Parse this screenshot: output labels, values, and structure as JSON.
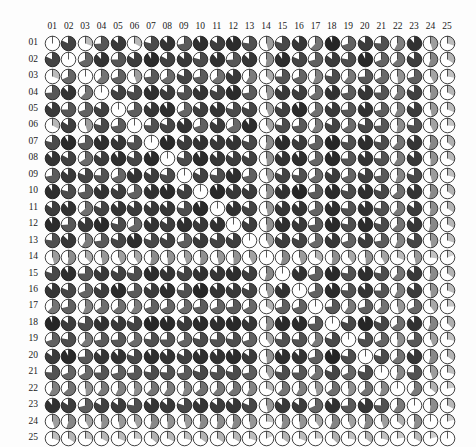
{
  "figure": {
    "type": "pie-glyph-matrix",
    "background_color": "#fdfdfd",
    "grid_left": 44,
    "grid_top": 35,
    "cell_pitch": 16.45,
    "glyph_radius": 7.3,
    "outline_color": "#111111",
    "empty_color": "#ffffff"
  },
  "chart_data": {
    "type": "heatmap",
    "title": "",
    "subtitle": "",
    "xlabel": "",
    "ylabel": "",
    "legend": [],
    "grid": false,
    "encoding": {
      "glyph": "pie",
      "start_angle_deg": 0,
      "direction": "clockwise",
      "value_to_sweep": "fraction of 360 degrees",
      "value_to_shade": "darker grey for larger magnitude",
      "diagonal": "empty white circle (self-reference)",
      "symmetric": true
    },
    "shade_scale": {
      "stops": [
        {
          "value": 0.0,
          "color": "#ffffff"
        },
        {
          "value": 0.15,
          "color": "#d8d8d8"
        },
        {
          "value": 0.3,
          "color": "#bdbdbd"
        },
        {
          "value": 0.45,
          "color": "#9e9e9e"
        },
        {
          "value": 0.6,
          "color": "#7a7a7a"
        },
        {
          "value": 0.75,
          "color": "#555555"
        },
        {
          "value": 0.88,
          "color": "#333333"
        },
        {
          "value": 1.0,
          "color": "#151515"
        }
      ]
    },
    "xlim": [
      0,
      25
    ],
    "ylim": [
      0,
      25
    ],
    "categories": [
      "01",
      "02",
      "03",
      "04",
      "05",
      "06",
      "07",
      "08",
      "09",
      "10",
      "11",
      "12",
      "13",
      "14",
      "15",
      "16",
      "17",
      "18",
      "19",
      "20",
      "21",
      "22",
      "23",
      "24",
      "25"
    ],
    "column_labels": [
      "01",
      "02",
      "03",
      "04",
      "05",
      "06",
      "07",
      "08",
      "09",
      "10",
      "11",
      "12",
      "13",
      "14",
      "15",
      "16",
      "17",
      "18",
      "19",
      "20",
      "21",
      "22",
      "23",
      "24",
      "25"
    ],
    "row_labels": [
      "01",
      "02",
      "03",
      "04",
      "05",
      "06",
      "07",
      "08",
      "09",
      "10",
      "11",
      "12",
      "13",
      "14",
      "15",
      "16",
      "17",
      "18",
      "19",
      "20",
      "21",
      "22",
      "23",
      "24",
      "25"
    ],
    "values": [
      [
        0.0,
        0.82,
        0.31,
        0.74,
        0.86,
        0.33,
        0.79,
        0.88,
        0.72,
        0.9,
        0.84,
        0.91,
        0.77,
        0.46,
        0.8,
        0.87,
        0.62,
        0.93,
        0.7,
        0.85,
        0.76,
        0.58,
        0.89,
        0.45,
        0.3
      ],
      [
        0.82,
        0.0,
        0.68,
        0.88,
        0.75,
        0.84,
        0.91,
        0.83,
        0.86,
        0.79,
        0.89,
        0.74,
        0.87,
        0.52,
        0.9,
        0.81,
        0.71,
        0.85,
        0.78,
        0.92,
        0.69,
        0.63,
        0.84,
        0.55,
        0.34
      ],
      [
        0.31,
        0.68,
        0.0,
        0.62,
        0.7,
        0.45,
        0.73,
        0.66,
        0.81,
        0.72,
        0.64,
        0.86,
        0.59,
        0.38,
        0.75,
        0.69,
        0.56,
        0.78,
        0.61,
        0.74,
        0.67,
        0.49,
        0.71,
        0.42,
        0.28
      ],
      [
        0.74,
        0.88,
        0.62,
        0.0,
        0.83,
        0.79,
        0.9,
        0.85,
        0.76,
        0.88,
        0.82,
        0.91,
        0.73,
        0.48,
        0.86,
        0.84,
        0.65,
        0.89,
        0.72,
        0.87,
        0.75,
        0.6,
        0.83,
        0.51,
        0.33
      ],
      [
        0.86,
        0.75,
        0.7,
        0.83,
        0.0,
        0.72,
        0.87,
        0.9,
        0.68,
        0.84,
        0.88,
        0.79,
        0.81,
        0.44,
        0.83,
        0.91,
        0.64,
        0.86,
        0.74,
        0.89,
        0.71,
        0.57,
        0.85,
        0.47,
        0.31
      ],
      [
        0.33,
        0.84,
        0.45,
        0.79,
        0.72,
        0.0,
        0.76,
        0.81,
        0.88,
        0.7,
        0.85,
        0.67,
        0.9,
        0.41,
        0.78,
        0.73,
        0.59,
        0.82,
        0.66,
        0.8,
        0.74,
        0.52,
        0.77,
        0.43,
        0.26
      ],
      [
        0.79,
        0.91,
        0.73,
        0.9,
        0.87,
        0.76,
        0.0,
        0.92,
        0.84,
        0.89,
        0.86,
        0.88,
        0.8,
        0.53,
        0.91,
        0.85,
        0.7,
        0.93,
        0.77,
        0.9,
        0.78,
        0.62,
        0.87,
        0.54,
        0.36
      ],
      [
        0.88,
        0.83,
        0.66,
        0.85,
        0.9,
        0.81,
        0.92,
        0.0,
        0.79,
        0.91,
        0.87,
        0.84,
        0.83,
        0.49,
        0.88,
        0.9,
        0.68,
        0.92,
        0.75,
        0.88,
        0.76,
        0.59,
        0.86,
        0.5,
        0.32
      ],
      [
        0.72,
        0.86,
        0.81,
        0.76,
        0.68,
        0.88,
        0.84,
        0.79,
        0.0,
        0.83,
        0.78,
        0.9,
        0.71,
        0.45,
        0.82,
        0.77,
        0.66,
        0.85,
        0.69,
        0.83,
        0.73,
        0.55,
        0.8,
        0.46,
        0.29
      ],
      [
        0.9,
        0.79,
        0.72,
        0.88,
        0.84,
        0.7,
        0.89,
        0.91,
        0.83,
        0.0,
        0.92,
        0.86,
        0.85,
        0.51,
        0.89,
        0.93,
        0.72,
        0.91,
        0.79,
        0.9,
        0.8,
        0.64,
        0.88,
        0.53,
        0.35
      ],
      [
        0.84,
        0.89,
        0.64,
        0.82,
        0.88,
        0.85,
        0.86,
        0.87,
        0.78,
        0.92,
        0.0,
        0.89,
        0.82,
        0.47,
        0.87,
        0.88,
        0.69,
        0.9,
        0.76,
        0.89,
        0.77,
        0.61,
        0.85,
        0.52,
        0.34
      ],
      [
        0.91,
        0.74,
        0.86,
        0.91,
        0.79,
        0.67,
        0.88,
        0.84,
        0.9,
        0.86,
        0.89,
        0.0,
        0.84,
        0.5,
        0.9,
        0.86,
        0.73,
        0.92,
        0.78,
        0.91,
        0.79,
        0.63,
        0.87,
        0.54,
        0.33
      ],
      [
        0.77,
        0.87,
        0.59,
        0.73,
        0.81,
        0.9,
        0.8,
        0.83,
        0.71,
        0.85,
        0.82,
        0.84,
        0.0,
        0.43,
        0.84,
        0.82,
        0.67,
        0.87,
        0.7,
        0.85,
        0.72,
        0.56,
        0.81,
        0.48,
        0.3
      ],
      [
        0.46,
        0.52,
        0.38,
        0.48,
        0.44,
        0.41,
        0.53,
        0.49,
        0.45,
        0.51,
        0.47,
        0.5,
        0.43,
        0.0,
        0.54,
        0.46,
        0.35,
        0.52,
        0.4,
        0.49,
        0.42,
        0.31,
        0.47,
        0.27,
        0.19
      ],
      [
        0.8,
        0.9,
        0.75,
        0.86,
        0.83,
        0.78,
        0.91,
        0.88,
        0.82,
        0.89,
        0.87,
        0.9,
        0.84,
        0.54,
        0.0,
        0.89,
        0.71,
        0.92,
        0.77,
        0.9,
        0.78,
        0.62,
        0.86,
        0.53,
        0.35
      ],
      [
        0.87,
        0.81,
        0.69,
        0.84,
        0.91,
        0.73,
        0.85,
        0.9,
        0.77,
        0.93,
        0.88,
        0.86,
        0.82,
        0.46,
        0.89,
        0.0,
        0.7,
        0.91,
        0.76,
        0.88,
        0.75,
        0.58,
        0.85,
        0.49,
        0.31
      ],
      [
        0.62,
        0.71,
        0.56,
        0.65,
        0.64,
        0.59,
        0.7,
        0.68,
        0.66,
        0.72,
        0.69,
        0.73,
        0.67,
        0.35,
        0.71,
        0.7,
        0.0,
        0.74,
        0.6,
        0.71,
        0.63,
        0.47,
        0.68,
        0.4,
        0.25
      ],
      [
        0.93,
        0.85,
        0.78,
        0.89,
        0.86,
        0.82,
        0.93,
        0.92,
        0.85,
        0.91,
        0.9,
        0.92,
        0.87,
        0.52,
        0.92,
        0.91,
        0.74,
        0.0,
        0.8,
        0.93,
        0.81,
        0.65,
        0.89,
        0.56,
        0.37
      ],
      [
        0.7,
        0.78,
        0.61,
        0.72,
        0.74,
        0.66,
        0.77,
        0.75,
        0.69,
        0.79,
        0.76,
        0.78,
        0.7,
        0.4,
        0.77,
        0.76,
        0.6,
        0.8,
        0.0,
        0.78,
        0.68,
        0.51,
        0.74,
        0.44,
        0.28
      ],
      [
        0.85,
        0.92,
        0.74,
        0.87,
        0.89,
        0.8,
        0.9,
        0.88,
        0.83,
        0.9,
        0.89,
        0.91,
        0.85,
        0.49,
        0.9,
        0.88,
        0.71,
        0.93,
        0.78,
        0.0,
        0.79,
        0.63,
        0.87,
        0.54,
        0.35
      ],
      [
        0.76,
        0.69,
        0.67,
        0.75,
        0.71,
        0.74,
        0.78,
        0.76,
        0.73,
        0.8,
        0.77,
        0.79,
        0.72,
        0.42,
        0.78,
        0.75,
        0.63,
        0.81,
        0.68,
        0.79,
        0.0,
        0.54,
        0.76,
        0.45,
        0.29
      ],
      [
        0.58,
        0.63,
        0.49,
        0.6,
        0.57,
        0.52,
        0.62,
        0.59,
        0.55,
        0.64,
        0.61,
        0.63,
        0.56,
        0.31,
        0.62,
        0.58,
        0.47,
        0.65,
        0.51,
        0.63,
        0.54,
        0.0,
        0.6,
        0.36,
        0.23
      ],
      [
        0.89,
        0.84,
        0.71,
        0.83,
        0.85,
        0.77,
        0.87,
        0.86,
        0.8,
        0.88,
        0.85,
        0.87,
        0.81,
        0.47,
        0.86,
        0.85,
        0.68,
        0.89,
        0.74,
        0.87,
        0.76,
        0.6,
        0.0,
        0.52,
        0.33
      ],
      [
        0.45,
        0.55,
        0.42,
        0.51,
        0.47,
        0.43,
        0.54,
        0.5,
        0.46,
        0.53,
        0.52,
        0.54,
        0.48,
        0.27,
        0.53,
        0.49,
        0.4,
        0.56,
        0.44,
        0.54,
        0.45,
        0.36,
        0.52,
        0.0,
        0.21
      ],
      [
        0.3,
        0.34,
        0.28,
        0.33,
        0.31,
        0.26,
        0.36,
        0.32,
        0.29,
        0.35,
        0.34,
        0.33,
        0.3,
        0.19,
        0.35,
        0.31,
        0.25,
        0.37,
        0.28,
        0.35,
        0.29,
        0.23,
        0.33,
        0.21,
        0.0
      ]
    ]
  }
}
